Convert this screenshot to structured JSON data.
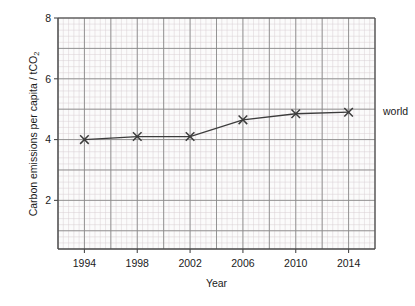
{
  "chart_data": {
    "type": "line",
    "title": "",
    "xlabel": "Year",
    "ylabel_prefix": "Carbon emissions per capita / tCO",
    "ylabel_sub": "2",
    "ylabel_full": "Carbon emissions per capita / tCO2",
    "xlim": [
      1992,
      2016
    ],
    "ylim": [
      0.4,
      8.0
    ],
    "x_ticks": [
      1994,
      1998,
      2002,
      2006,
      2010,
      2014
    ],
    "x_tick_labels": [
      "1994",
      "1998",
      "2002",
      "2006",
      "2010",
      "2014"
    ],
    "y_ticks": [
      2,
      4,
      6,
      8
    ],
    "y_tick_labels": [
      "2",
      "4",
      "6",
      "8"
    ],
    "x_major_step": 2,
    "y_major_step": 1,
    "x_minor_per_major": 5,
    "y_minor_per_major": 5,
    "grid": true,
    "legend_position": "right-of-axes",
    "series": [
      {
        "name": "world",
        "marker": "x",
        "color": "#3c3c3c",
        "x": [
          1994,
          1998,
          2002,
          2006,
          2010,
          2014
        ],
        "values": [
          4.0,
          4.1,
          4.1,
          4.65,
          4.85,
          4.9
        ]
      }
    ],
    "annotations": [
      {
        "text": "world",
        "x": 2016,
        "y": 4.9
      }
    ],
    "colors": {
      "axis": "#4a4a4a",
      "major_grid": "#8a8a8a",
      "minor_grid": "#d8cfd2",
      "line": "#3c3c3c",
      "background": "#ffffff",
      "plot_background": "#fbfbfb"
    }
  }
}
